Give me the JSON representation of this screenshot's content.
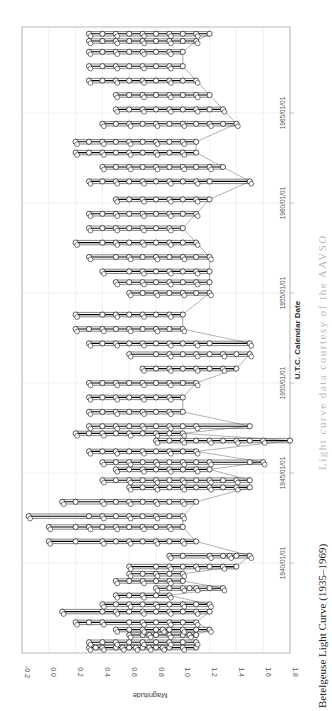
{
  "caption": {
    "title": "Betelgeuse Light Curve (1935–1969)",
    "credit": "Light curve data courtesy of the AAVSO"
  },
  "chart_data": {
    "type": "line",
    "title": "Betelgeuse Light Curve (1935–1969)",
    "xlabel": "U.T.C. Calendar Date",
    "ylabel": "Magnitude",
    "orientation": "rotated 90° clockwise (date axis vertical, magnitude axis horizontal)",
    "xlim": [
      "1935/01/01",
      "1969/10/01"
    ],
    "ylim": [
      -0.2,
      1.8
    ],
    "y_inverted": false,
    "grid": true,
    "marker": "open circle",
    "magnitude_ticks": [
      "-0.2",
      "0.0",
      "0.2",
      "0.4",
      "0.6",
      "0.8",
      "1.0",
      "1.2",
      "1.4",
      "1.6",
      "1.8"
    ],
    "date_ticks": [
      "1940/01/01",
      "1945/01/01",
      "1950/01/01",
      "1955/01/01",
      "1960/01/01",
      "1965/01/01"
    ],
    "series": [
      {
        "name": "Visual observations",
        "points": [
          {
            "year": 1935.3,
            "mags": [
              0.3,
              0.35,
              0.4,
              0.5,
              0.55,
              0.6,
              0.65,
              0.7,
              0.75,
              0.8,
              0.85,
              0.9,
              1.0,
              1.1
            ]
          },
          {
            "year": 1935.6,
            "mags": [
              0.3,
              0.4,
              0.5,
              0.6,
              0.7,
              0.8,
              0.9,
              1.0,
              1.1
            ]
          },
          {
            "year": 1936.0,
            "mags": [
              0.6,
              0.7,
              0.75,
              0.8,
              0.9,
              1.0,
              1.05,
              1.1
            ]
          },
          {
            "year": 1936.3,
            "mags": [
              0.5,
              0.6,
              0.7,
              0.8,
              0.85,
              0.9,
              1.0,
              1.1,
              1.2
            ]
          },
          {
            "year": 1936.7,
            "mags": [
              0.2,
              0.3,
              0.4,
              0.6,
              0.7,
              0.8,
              0.9,
              1.0,
              1.1
            ]
          },
          {
            "year": 1937.3,
            "mags": [
              0.1,
              0.4,
              0.5,
              0.6,
              0.7,
              0.8,
              0.9,
              1.0,
              1.1,
              1.2
            ]
          },
          {
            "year": 1937.7,
            "mags": [
              0.4,
              0.5,
              0.6,
              0.7,
              0.8,
              0.9,
              1.0,
              1.1,
              1.2
            ]
          },
          {
            "year": 1938.2,
            "mags": [
              0.5,
              0.6,
              0.7,
              0.8,
              0.9
            ]
          },
          {
            "year": 1938.6,
            "mags": [
              0.8,
              0.9,
              1.0,
              1.05,
              1.1,
              1.2,
              1.3
            ]
          },
          {
            "year": 1939.0,
            "mags": [
              0.5,
              0.6,
              0.7,
              0.8,
              0.9,
              1.0
            ]
          },
          {
            "year": 1939.4,
            "mags": [
              0.6,
              0.7,
              0.8,
              0.9,
              1.0
            ]
          },
          {
            "year": 1939.8,
            "mags": [
              0.6,
              0.8,
              0.9,
              1.0,
              1.1,
              1.2,
              1.3,
              1.4
            ]
          },
          {
            "year": 1940.4,
            "mags": [
              0.9,
              1.0,
              1.2,
              1.3,
              1.35,
              1.4,
              1.5
            ]
          },
          {
            "year": 1941.2,
            "mags": [
              0.0,
              0.2,
              0.4,
              0.5,
              0.6,
              0.7,
              0.8,
              0.9,
              1.0,
              1.1
            ]
          },
          {
            "year": 1942.0,
            "mags": [
              0.0,
              0.2,
              0.3,
              0.4,
              0.5,
              0.6,
              0.7,
              0.8,
              0.9,
              1.0
            ]
          },
          {
            "year": 1942.6,
            "mags": [
              -0.15,
              0.3,
              0.4,
              0.5,
              0.6,
              0.7,
              0.8,
              0.9,
              1.0
            ]
          },
          {
            "year": 1943.4,
            "mags": [
              0.1,
              0.2,
              0.4,
              0.5,
              0.6,
              0.7,
              0.8,
              0.9,
              1.0,
              1.1
            ]
          },
          {
            "year": 1944.2,
            "mags": [
              0.6,
              0.7,
              0.8,
              0.9,
              1.0,
              1.1,
              1.2,
              1.3,
              1.4,
              1.5
            ]
          },
          {
            "year": 1944.6,
            "mags": [
              0.4,
              0.5,
              0.6,
              0.7,
              0.8,
              0.9,
              1.0,
              1.1,
              1.2,
              1.3,
              1.4,
              1.5
            ]
          },
          {
            "year": 1945.2,
            "mags": [
              0.5,
              0.6,
              0.7,
              0.8,
              0.9,
              1.0,
              1.1,
              1.2
            ]
          },
          {
            "year": 1945.6,
            "mags": [
              0.4,
              0.5,
              0.6,
              0.7,
              0.8,
              0.9,
              1.0,
              1.1,
              1.2,
              1.5,
              1.6
            ]
          },
          {
            "year": 1946.2,
            "mags": [
              0.3,
              0.4,
              0.5,
              0.6,
              0.7,
              0.8,
              0.9,
              1.0,
              1.1
            ]
          },
          {
            "year": 1946.8,
            "mags": [
              0.8,
              0.9,
              1.0,
              1.1,
              1.2,
              1.3,
              1.4,
              1.5,
              1.6,
              1.8
            ]
          },
          {
            "year": 1947.2,
            "mags": [
              0.2,
              0.3,
              0.4,
              0.5,
              0.6,
              0.7,
              0.8,
              0.9,
              1.0
            ]
          },
          {
            "year": 1947.6,
            "mags": [
              0.3,
              0.4,
              0.5,
              0.6,
              0.7,
              0.8,
              0.9,
              1.0,
              1.1,
              1.5
            ]
          },
          {
            "year": 1948.4,
            "mags": [
              0.3,
              0.4,
              0.5,
              0.6,
              0.7,
              0.8,
              0.9,
              1.0
            ]
          },
          {
            "year": 1949.2,
            "mags": [
              0.3,
              0.4,
              0.5,
              0.6,
              0.7,
              0.8,
              0.9,
              1.0
            ]
          },
          {
            "year": 1950.0,
            "mags": [
              0.3,
              0.4,
              0.5,
              0.6,
              0.7,
              0.8,
              0.9,
              1.0,
              1.1
            ]
          },
          {
            "year": 1950.8,
            "mags": [
              0.7,
              0.8,
              0.9,
              1.0,
              1.1,
              1.2,
              1.3,
              1.4
            ]
          },
          {
            "year": 1951.6,
            "mags": [
              0.6,
              0.8,
              0.9,
              1.0,
              1.1,
              1.2,
              1.3,
              1.4,
              1.5
            ]
          },
          {
            "year": 1952.2,
            "mags": [
              0.3,
              0.4,
              0.5,
              0.6,
              0.7,
              0.8,
              0.9,
              1.0,
              1.1,
              1.2,
              1.5
            ]
          },
          {
            "year": 1953.0,
            "mags": [
              0.2,
              0.3,
              0.4,
              0.5,
              0.6,
              0.7,
              0.8,
              0.9,
              1.0
            ]
          },
          {
            "year": 1953.8,
            "mags": [
              0.2,
              0.4,
              0.5,
              0.6,
              0.7,
              0.8,
              0.9,
              1.0
            ]
          },
          {
            "year": 1955.0,
            "mags": [
              0.6,
              0.7,
              0.8,
              0.9,
              1.0,
              1.1,
              1.2
            ]
          },
          {
            "year": 1955.6,
            "mags": [
              0.5,
              0.6,
              0.7,
              0.8,
              0.9,
              1.0,
              1.1,
              1.2
            ]
          },
          {
            "year": 1956.2,
            "mags": [
              0.4,
              0.6,
              0.7,
              0.8,
              0.9,
              1.0,
              1.1,
              1.2
            ]
          },
          {
            "year": 1957.0,
            "mags": [
              0.3,
              0.5,
              0.6,
              0.7,
              0.8,
              0.9,
              1.0,
              1.1,
              1.2
            ]
          },
          {
            "year": 1957.8,
            "mags": [
              0.2,
              0.4,
              0.5,
              0.6,
              0.7,
              0.8,
              0.9,
              1.0,
              1.1
            ]
          },
          {
            "year": 1958.6,
            "mags": [
              0.3,
              0.4,
              0.5,
              0.6,
              0.7,
              0.8,
              0.9,
              1.0
            ]
          },
          {
            "year": 1959.4,
            "mags": [
              0.3,
              0.4,
              0.5,
              0.6,
              0.7,
              0.8,
              0.9,
              1.0,
              1.1
            ]
          },
          {
            "year": 1960.2,
            "mags": [
              0.5,
              0.6,
              0.7,
              0.8,
              0.9,
              1.0,
              1.1,
              1.2
            ]
          },
          {
            "year": 1961.2,
            "mags": [
              0.3,
              0.4,
              0.5,
              0.6,
              0.7,
              0.8,
              0.9,
              1.0,
              1.1,
              1.2,
              1.5
            ]
          },
          {
            "year": 1962.0,
            "mags": [
              0.4,
              0.5,
              0.6,
              0.7,
              0.8,
              0.9,
              1.0,
              1.1,
              1.2,
              1.3
            ]
          },
          {
            "year": 1962.8,
            "mags": [
              0.2,
              0.3,
              0.4,
              0.5,
              0.6,
              0.7,
              0.8,
              0.9,
              1.0,
              1.1
            ]
          },
          {
            "year": 1963.4,
            "mags": [
              0.2,
              0.3,
              0.4,
              0.5,
              0.6,
              0.7,
              0.8,
              0.9,
              1.0,
              1.1
            ]
          },
          {
            "year": 1964.4,
            "mags": [
              0.4,
              0.5,
              0.6,
              0.7,
              0.8,
              0.9,
              1.0,
              1.1,
              1.2,
              1.3,
              1.4
            ]
          },
          {
            "year": 1965.2,
            "mags": [
              0.5,
              0.6,
              0.7,
              0.8,
              0.9,
              1.0,
              1.1,
              1.2,
              1.3
            ]
          },
          {
            "year": 1966.0,
            "mags": [
              0.5,
              0.6,
              0.7,
              0.8,
              0.9,
              1.0,
              1.1,
              1.2
            ]
          },
          {
            "year": 1966.8,
            "mags": [
              0.3,
              0.4,
              0.5,
              0.6,
              0.7,
              0.8,
              0.9,
              1.0,
              1.1
            ]
          },
          {
            "year": 1967.6,
            "mags": [
              0.3,
              0.4,
              0.5,
              0.6,
              0.7,
              0.8,
              0.9,
              1.0
            ]
          },
          {
            "year": 1968.4,
            "mags": [
              0.3,
              0.4,
              0.5,
              0.6,
              0.7,
              0.8,
              0.9,
              1.0
            ]
          },
          {
            "year": 1969.0,
            "mags": [
              0.3,
              0.4,
              0.5,
              0.6,
              0.7,
              0.8,
              0.9,
              1.0,
              1.1
            ]
          },
          {
            "year": 1969.4,
            "mags": [
              0.3,
              0.4,
              0.5,
              0.6,
              0.7,
              0.8,
              0.9,
              1.0,
              1.1,
              1.2
            ]
          }
        ]
      }
    ]
  }
}
